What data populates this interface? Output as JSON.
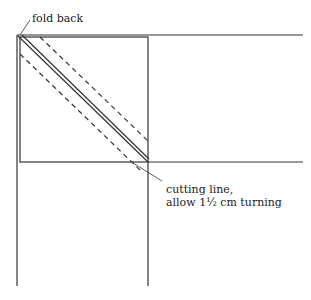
{
  "diagram": {
    "labels": {
      "fold_back": "fold back",
      "cutting_line_1": "cutting line,",
      "cutting_line_2": "allow 1½ cm turning"
    },
    "colors": {
      "line": "#333333",
      "background": "#ffffff"
    }
  }
}
